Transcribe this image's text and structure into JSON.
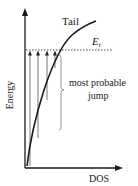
{
  "diagram": {
    "y_axis_label": "Energy",
    "x_axis_label": "DOS",
    "curve_label": "Tail",
    "level_label_main": "E",
    "level_label_sub": "t",
    "annotation_line1": "most probable",
    "annotation_line2": "jump",
    "arrow_count": 4,
    "colors": {
      "axis": "#1a1a1a",
      "curve": "#1a1a1a",
      "dotted_line": "#333333",
      "arrows": "#555555",
      "brace": "#777777"
    }
  }
}
